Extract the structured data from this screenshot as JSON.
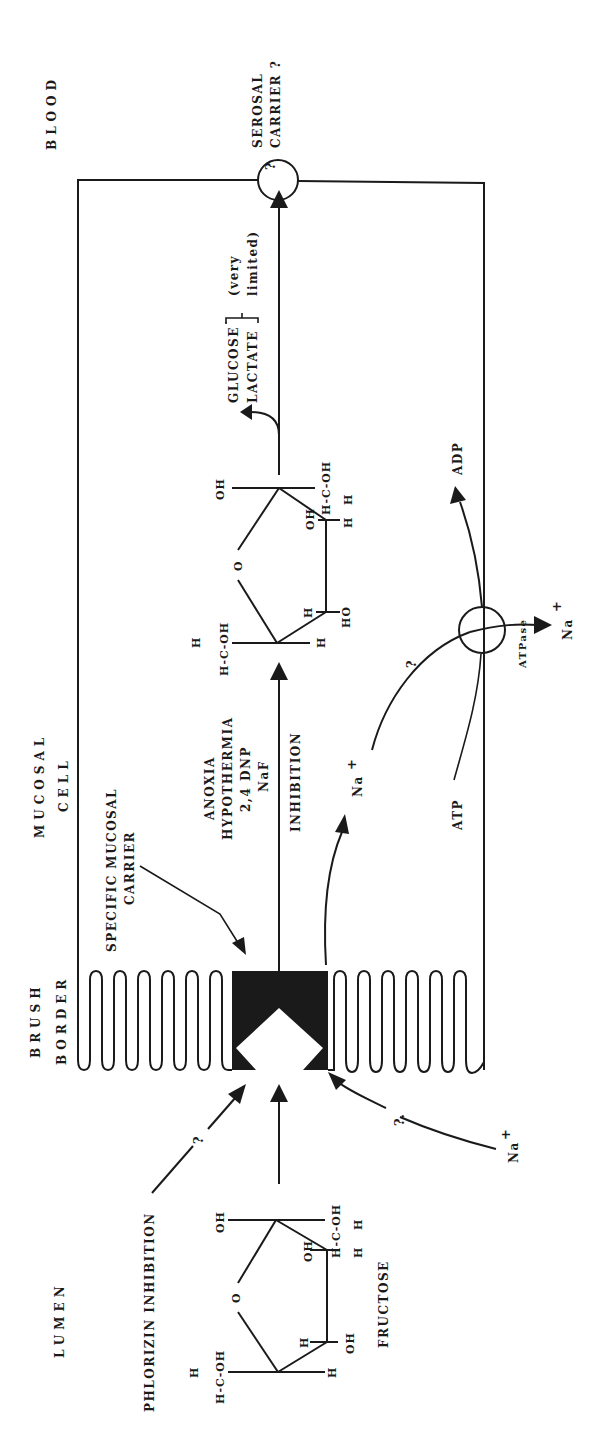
{
  "figure": {
    "orientation": "rotated 90 degrees counter-clockwise",
    "zones": {
      "lumen": "LUMEN",
      "brush_border_line1": "BRUSH",
      "brush_border_line2": "BORDER",
      "mucosal_cell_line1": "MUCOSAL",
      "mucosal_cell_line2": "CELL",
      "blood": "BLOOD"
    },
    "labels": {
      "serosal_carrier_line1": "SEROSAL",
      "serosal_carrier_line2": "CARRIER ?",
      "serosal_question": "?",
      "specific_carrier_line1": "SPECIFIC MUCOSAL",
      "specific_carrier_line2": "CARRIER",
      "inhibitors_line1": "ANOXIA",
      "inhibitors_line2": "HYPOTHERMIA",
      "inhibitors_line3": "2,4 DNP",
      "inhibitors_line4": "NaF",
      "inhibition": "INHIBITION",
      "phlorizin": "PHLORIZIN INHIBITION",
      "phlorizin_question": "?",
      "fructose": "FRUCTOSE",
      "glucose": "GLUCOSE",
      "lactate": "LACTATE",
      "very": "(very",
      "limited": "limited)",
      "atp": "ATP",
      "adp": "ADP",
      "atpase": "ATPase",
      "na_ion": "Na",
      "plus": "+",
      "na_lumen_question": "?.",
      "na_cell_question": "?"
    },
    "fructose_molecule_lumen": {
      "top_left_group": "H-C-OH",
      "top_left_h": "H",
      "ring_o": "O",
      "left_oh": "OH",
      "right_h1": "H",
      "right_oh": "OH",
      "right_h2": "H",
      "bottom_h": "H",
      "bottom_group": "H-C-OH",
      "bottom_h2": "H",
      "oh_inner": "OH"
    },
    "fructose_molecule_cell": {
      "top_left_group": "H-C-OH",
      "top_left_h": "H",
      "ring_o": "O",
      "left_oh": "OH",
      "right_h1": "H",
      "right_oh": "HO",
      "right_h2": "H",
      "bottom_group": "H-C-OH",
      "bottom_h": "H",
      "oh_inner": "OH"
    },
    "colors": {
      "ink": "#1a1a1a",
      "background": "#ffffff"
    }
  }
}
